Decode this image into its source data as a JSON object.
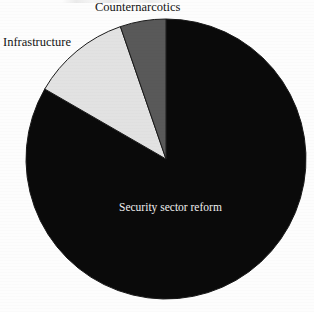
{
  "chart_data": {
    "type": "pie",
    "title": "",
    "subtitle": "",
    "xlabel": "",
    "ylabel": "",
    "legend_position": "none",
    "grid": false,
    "labels_placement": "on-and-around-slices",
    "categories": [
      "Security sector reform",
      "Infrastructure",
      "Counternarcotics"
    ],
    "values": [
      83,
      12,
      5
    ],
    "units": "percent",
    "slices": [
      {
        "label": "Security sector reform",
        "value": 83,
        "start_angle_deg": 0,
        "end_angle_deg": 300,
        "color": "#0a0a0a",
        "label_color": "#f0f0f0",
        "label_inside": true
      },
      {
        "label": "Infrastructure",
        "value": 12,
        "start_angle_deg": 300,
        "end_angle_deg": 341,
        "color": "#e2e2e2",
        "label_color": "#141414",
        "label_inside": false
      },
      {
        "label": "Counternarcotics",
        "value": 5,
        "start_angle_deg": 341,
        "end_angle_deg": 360,
        "color": "#595959",
        "label_color": "#141414",
        "label_inside": false
      }
    ]
  },
  "labels": {
    "counternarcotics": "Counternarcotics",
    "infrastructure": "Infrastructure",
    "security_sector_reform": "Security sector reform"
  },
  "colors": {
    "background": "#fdfdfd",
    "slice_security_sector_reform": "#0a0a0a",
    "slice_infrastructure": "#e2e2e2",
    "slice_counternarcotics": "#595959",
    "slice_outline": "#1a1a1a",
    "label_dark": "#141414",
    "label_light": "#f0f0f0"
  },
  "geometry": {
    "center_x": 166,
    "center_y": 159,
    "radius": 140
  }
}
